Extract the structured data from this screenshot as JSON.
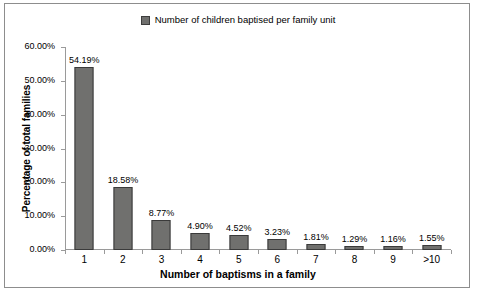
{
  "legend": {
    "label": "Number of children baptised per family unit",
    "swatch_color": "#70706e",
    "position": "top-center"
  },
  "axes": {
    "x_title": "Number of baptisms in a family",
    "y_title": "Percentage of total families"
  },
  "chart_data": {
    "type": "bar",
    "title": "",
    "subtitle": "",
    "xlabel": "Number of baptisms in a family",
    "ylabel": "Percentage of total families",
    "categories": [
      "1",
      "2",
      "3",
      "4",
      "5",
      "6",
      "7",
      "8",
      "9",
      ">10"
    ],
    "values": [
      54.19,
      18.58,
      8.77,
      4.9,
      4.52,
      3.23,
      1.81,
      1.29,
      1.16,
      1.55
    ],
    "data_labels": [
      "54.19%",
      "18.58%",
      "8.77%",
      "4.90%",
      "4.52%",
      "3.23%",
      "1.81%",
      "1.29%",
      "1.16%",
      "1.55%"
    ],
    "series": [
      {
        "name": "Number of children baptised per family unit",
        "color": "#70706e",
        "values": [
          54.19,
          18.58,
          8.77,
          4.9,
          4.52,
          3.23,
          1.81,
          1.29,
          1.16,
          1.55
        ]
      }
    ],
    "ylim": [
      0,
      60
    ],
    "y_ticks": [
      0,
      10,
      20,
      30,
      40,
      50,
      60
    ],
    "y_tick_labels": [
      "0.00%",
      "10.00%",
      "20.00%",
      "30.00%",
      "40.00%",
      "50.00%",
      "60.00%"
    ],
    "grid": false,
    "legend_position": "top-center",
    "bar_color": "#70706e",
    "bar_border_color": "#3a3a3a",
    "axis_color": "#9a9a9a"
  }
}
